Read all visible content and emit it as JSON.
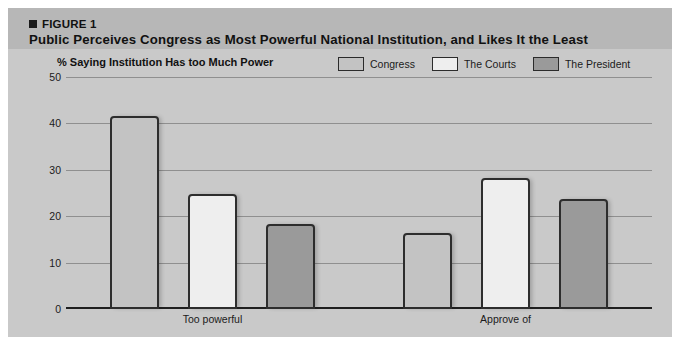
{
  "figure": {
    "label": "FIGURE 1",
    "marker_icon": "square-bullet-icon",
    "title": "Public Perceives Congress as Most Powerful National Institution, and Likes It the Least",
    "band_color": "#b7b7b7",
    "panel_color": "#c9c9c9"
  },
  "chart_data": {
    "type": "bar",
    "title": "Public Perceives Congress as Most Powerful National Institution, and Likes It the Least",
    "subtitle": "% Saying Institution Has too Much Power",
    "xlabel": "",
    "ylabel": "",
    "ylim": [
      0,
      50
    ],
    "ytick_step": 10,
    "yticks": [
      50,
      40,
      30,
      20,
      10,
      0
    ],
    "grid": true,
    "legend_position": "top-right",
    "categories": [
      "Too powerful",
      "Approve of"
    ],
    "series": [
      {
        "name": "Congress",
        "color": "#c3c3c3",
        "values": [
          41.5,
          16.4
        ]
      },
      {
        "name": "The Courts",
        "color": "#eeeeee",
        "values": [
          24.7,
          28.3
        ]
      },
      {
        "name": "The President",
        "color": "#9a9a9a",
        "values": [
          18.4,
          23.8
        ]
      }
    ]
  }
}
